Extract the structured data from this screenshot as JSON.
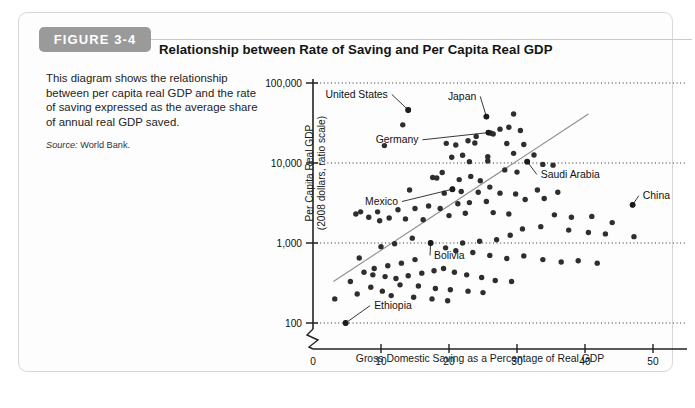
{
  "figure": {
    "badge_label": "FIGURE 3-4",
    "title": "Relationship between Rate of Saving and Per Capita Real GDP",
    "caption": "This diagram shows the relationship between per capita real GDP and the rate of saving expressed as the average share of annual real GDP saved.",
    "source_label": "Source:",
    "source_value": "World Bank."
  },
  "chart_data": {
    "type": "scatter",
    "title": "Relationship between Rate of Saving and Per Capita Real GDP",
    "xlabel": "Gross Domestic Saving as a Percentage of Real GDP",
    "ylabel": "Per Capita Real GDP\n(2008 dollars, ratio scale)",
    "ylabel_line1": "Per Capita Real GDP",
    "ylabel_line2": "(2008 dollars, ratio scale)",
    "yscale": "log",
    "ylim": [
      100,
      100000
    ],
    "xlim": [
      0,
      55
    ],
    "grid": "horizontal-dotted",
    "legend": "none",
    "axis_break": true,
    "xticks": [
      0,
      10,
      20,
      30,
      40,
      50
    ],
    "xticklabels": [
      "0",
      "10",
      "20",
      "30",
      "40",
      "50"
    ],
    "yticks": [
      100,
      1000,
      10000,
      100000
    ],
    "yticklabels": [
      "100",
      "1,000",
      "10,000",
      "100,000"
    ],
    "trendline": {
      "x0": 3.0,
      "y0": 330,
      "x1": 40.5,
      "y1": 41000
    },
    "annotations": [
      {
        "label": "United States",
        "x": 14.0,
        "y": 46000,
        "text_x": 11.0,
        "text_y": 72000
      },
      {
        "label": "Japan",
        "x": 25.5,
        "y": 38000,
        "text_x": 24.0,
        "text_y": 68000
      },
      {
        "label": "Germany",
        "x": 25.8,
        "y": 24000,
        "text_x": 15.5,
        "text_y": 19500
      },
      {
        "label": "Saudi Arabia",
        "x": 31.5,
        "y": 10400,
        "text_x": 33.5,
        "text_y": 7200
      },
      {
        "label": "China",
        "x": 47.0,
        "y": 3000,
        "text_x": 48.5,
        "text_y": 3900
      },
      {
        "label": "Mexico",
        "x": 20.5,
        "y": 4700,
        "text_x": 12.5,
        "text_y": 3300
      },
      {
        "label": "Bolivia",
        "x": 17.3,
        "y": 1000,
        "text_x": 17.8,
        "text_y": 700
      },
      {
        "label": "Ethiopia",
        "x": 4.8,
        "y": 100,
        "text_x": 9.0,
        "text_y": 165
      }
    ],
    "points": [
      [
        14.0,
        46000
      ],
      [
        13.2,
        30000
      ],
      [
        25.5,
        38000
      ],
      [
        29.5,
        41000
      ],
      [
        28.8,
        28000
      ],
      [
        30.5,
        25500
      ],
      [
        27.5,
        26500
      ],
      [
        26.2,
        23500
      ],
      [
        26.5,
        23000
      ],
      [
        24.0,
        21500
      ],
      [
        22.8,
        19000
      ],
      [
        23.8,
        17800
      ],
      [
        21.0,
        16800
      ],
      [
        19.6,
        17600
      ],
      [
        10.5,
        16500
      ],
      [
        28.5,
        17500
      ],
      [
        31.0,
        17000
      ],
      [
        25.8,
        24000
      ],
      [
        25.7,
        12000
      ],
      [
        25.7,
        10600
      ],
      [
        29.5,
        13200
      ],
      [
        22.0,
        12500
      ],
      [
        20.4,
        11800
      ],
      [
        23.0,
        10400
      ],
      [
        31.5,
        10400
      ],
      [
        32.5,
        12600
      ],
      [
        33.8,
        9600
      ],
      [
        35.3,
        9400
      ],
      [
        28.2,
        8200
      ],
      [
        30.0,
        7700
      ],
      [
        19.0,
        7600
      ],
      [
        17.6,
        6600
      ],
      [
        18.2,
        6500
      ],
      [
        21.5,
        6200
      ],
      [
        23.2,
        6800
      ],
      [
        24.6,
        6000
      ],
      [
        20.5,
        4700
      ],
      [
        14.2,
        4600
      ],
      [
        19.3,
        4200
      ],
      [
        21.8,
        4400
      ],
      [
        24.3,
        4300
      ],
      [
        26.0,
        5000
      ],
      [
        27.5,
        4200
      ],
      [
        29.8,
        4100
      ],
      [
        33.0,
        4600
      ],
      [
        36.0,
        4300
      ],
      [
        34.0,
        3600
      ],
      [
        31.2,
        3500
      ],
      [
        25.5,
        3300
      ],
      [
        23.0,
        3200
      ],
      [
        21.3,
        3100
      ],
      [
        17.0,
        2900
      ],
      [
        15.0,
        2700
      ],
      [
        12.5,
        2600
      ],
      [
        9.5,
        2450
      ],
      [
        6.3,
        2300
      ],
      [
        8.2,
        2100
      ],
      [
        11.2,
        2050
      ],
      [
        13.6,
        2000
      ],
      [
        16.2,
        1950
      ],
      [
        18.7,
        2700
      ],
      [
        20.0,
        2200
      ],
      [
        22.4,
        2350
      ],
      [
        26.5,
        2400
      ],
      [
        28.8,
        2300
      ],
      [
        35.5,
        2250
      ],
      [
        38.0,
        2100
      ],
      [
        41.0,
        2150
      ],
      [
        44.0,
        1800
      ],
      [
        47.0,
        3000
      ],
      [
        47.2,
        1200
      ],
      [
        43.0,
        1300
      ],
      [
        40.5,
        1350
      ],
      [
        37.6,
        1450
      ],
      [
        33.5,
        1600
      ],
      [
        30.8,
        1500
      ],
      [
        29.0,
        1250
      ],
      [
        27.0,
        1100
      ],
      [
        24.5,
        1050
      ],
      [
        22.0,
        1000
      ],
      [
        17.3,
        1000
      ],
      [
        14.6,
        1150
      ],
      [
        12.0,
        980
      ],
      [
        10.0,
        900
      ],
      [
        19.5,
        870
      ],
      [
        21.0,
        800
      ],
      [
        23.5,
        760
      ],
      [
        26.0,
        700
      ],
      [
        28.5,
        640
      ],
      [
        31.0,
        690
      ],
      [
        33.8,
        620
      ],
      [
        36.5,
        580
      ],
      [
        39.0,
        600
      ],
      [
        41.8,
        560
      ],
      [
        15.0,
        620
      ],
      [
        13.0,
        560
      ],
      [
        11.0,
        520
      ],
      [
        9.0,
        480
      ],
      [
        7.5,
        430
      ],
      [
        8.8,
        400
      ],
      [
        10.6,
        380
      ],
      [
        12.2,
        360
      ],
      [
        14.0,
        390
      ],
      [
        16.0,
        420
      ],
      [
        17.8,
        450
      ],
      [
        19.2,
        480
      ],
      [
        20.8,
        430
      ],
      [
        22.6,
        400
      ],
      [
        24.8,
        370
      ],
      [
        26.8,
        340
      ],
      [
        29.2,
        330
      ],
      [
        12.8,
        300
      ],
      [
        15.5,
        290
      ],
      [
        18.0,
        270
      ],
      [
        20.2,
        260
      ],
      [
        22.8,
        250
      ],
      [
        25.0,
        240
      ],
      [
        10.2,
        250
      ],
      [
        8.5,
        280
      ],
      [
        6.5,
        230
      ],
      [
        11.5,
        220
      ],
      [
        14.8,
        210
      ],
      [
        17.5,
        200
      ],
      [
        19.8,
        190
      ],
      [
        4.8,
        100
      ],
      [
        3.2,
        200
      ],
      [
        5.5,
        330
      ],
      [
        6.8,
        650
      ],
      [
        9.8,
        1900
      ],
      [
        7.0,
        2450
      ]
    ]
  }
}
